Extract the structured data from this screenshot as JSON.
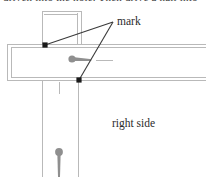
{
  "figure": {
    "type": "technical-line-drawing",
    "background_color": "#ffffff",
    "labels": {
      "mark": "mark",
      "right_side": "right side"
    },
    "cropped_header_text": "driven into the hole. Then drive a nail into",
    "colors": {
      "construction_line": "#b9b9b9",
      "leader_line": "#3a3a3a",
      "mark_dot": "#1a1a1a",
      "nail_gray": "#8f8f8f",
      "text": "#2b2b2b"
    },
    "elements": {
      "beam": {
        "name": "horizontal-beam",
        "top_edge_y": 44,
        "bottom_edge_y": 80,
        "left_end_x": 7,
        "right_end_x": 206
      },
      "post": {
        "name": "vertical-post",
        "left_edge_x": 42,
        "right_edge_x": 78,
        "top_y": 11,
        "bottom_y": 177
      },
      "mark_points": [
        {
          "name": "upper-mark-point",
          "x": 45,
          "y": 45
        },
        {
          "name": "lower-mark-point",
          "x": 79,
          "y": 80
        }
      ],
      "leader_convergence": {
        "x": 113,
        "y": 22
      },
      "nails": [
        {
          "name": "horizontal-nail",
          "head_x": 72,
          "head_y": 59,
          "tip_x": 92,
          "tip_y": 60
        },
        {
          "name": "vertical-nail",
          "head_x": 59,
          "head_y": 152,
          "tip_x": 59,
          "tip_y": 177
        }
      ],
      "guide_dash": {
        "name": "alignment-dash",
        "x1": 96,
        "x2": 113,
        "y": 60
      },
      "center_tick": {
        "name": "post-center-tick",
        "x": 59,
        "y1": 82,
        "y2": 94
      }
    }
  }
}
